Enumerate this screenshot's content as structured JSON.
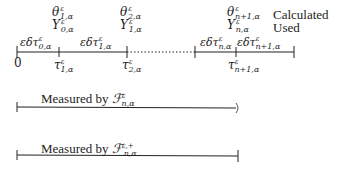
{
  "legend": {
    "calculated": "Calculated",
    "used": "Used"
  },
  "timeline": {
    "origin_label": "0",
    "top_labels": [
      {
        "theta": "θ",
        "theta_sup": "ε",
        "theta_sub": "1,α",
        "y": "Y",
        "y_sup": "ε",
        "y_sub": "0,α"
      },
      {
        "theta": "θ",
        "theta_sup": "ε",
        "theta_sub": "2,α",
        "y": "Y",
        "y_sup": "ε",
        "y_sub": "1,α"
      },
      {
        "theta": "θ",
        "theta_sup": "ε",
        "theta_sub": "n+1,α",
        "y": "Y",
        "y_sup": "ε",
        "y_sub": "n,α"
      }
    ],
    "interval_labels": [
      {
        "text": "εδτ",
        "sup": "ε",
        "sub": "0,α"
      },
      {
        "text": "εδτ",
        "sup": "ε",
        "sub": "1,α"
      },
      {
        "text": "εδτ",
        "sup": "ε",
        "sub": "n,α"
      },
      {
        "text": "εδτ",
        "sup": "ε",
        "sub": "n+1,α"
      }
    ],
    "tick_labels": [
      {
        "text": "τ",
        "sup": "ε",
        "sub": "1,α"
      },
      {
        "text": "τ",
        "sup": "ε",
        "sub": "2,α"
      },
      {
        "text": "τ",
        "sup": "ε",
        "sub": "n+1,α"
      }
    ]
  },
  "measures": [
    {
      "prefix": "Measured by ",
      "symbol": "ℱ",
      "sup": "ε",
      "sub": "n,α",
      "end": "open"
    },
    {
      "prefix": "Measured by ",
      "symbol": "ℱ",
      "sup": "ε,+",
      "sub": "n,α",
      "end": "closed"
    }
  ],
  "colors": {
    "line": "#222222",
    "background": "#ffffff"
  }
}
